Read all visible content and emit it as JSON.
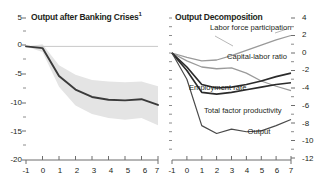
{
  "figure": {
    "background": "#ffffff",
    "line_color": "#3a3a3a",
    "band_color": "#e3e3e3",
    "axis_color": "#8c8c8c"
  },
  "chart_data": [
    {
      "type": "line",
      "panel": "left",
      "title": "Output after Banking Crises",
      "title_footnote": "1",
      "xlabel": "",
      "ylabel": "",
      "x": [
        -1,
        0,
        1,
        2,
        3,
        4,
        5,
        6,
        7
      ],
      "xlim": [
        -1,
        7
      ],
      "ylim": [
        -20,
        5
      ],
      "xticks": [
        "-1",
        "0",
        "1",
        "2",
        "3",
        "4",
        "5",
        "6",
        "7"
      ],
      "yticks": [
        "5",
        "0",
        "-5",
        "-10",
        "-15",
        "-20"
      ],
      "minor_yticks": [
        2.5,
        -2.5,
        -7.5,
        -12.5,
        -17.5
      ],
      "grid": false,
      "legend": "none",
      "zero_line": true,
      "series": [
        {
          "name": "Output",
          "values": [
            0.0,
            -0.3,
            -5.2,
            -7.6,
            -8.9,
            -9.4,
            -9.5,
            -9.3,
            -10.3
          ]
        }
      ],
      "confidence_band": {
        "name": "confidence interval",
        "upper": [
          0.0,
          0.4,
          -3.3,
          -5.0,
          -5.9,
          -6.2,
          -6.3,
          -6.2,
          -7.0
        ],
        "lower": [
          0.0,
          -1.0,
          -7.1,
          -10.4,
          -11.9,
          -12.6,
          -12.9,
          -12.6,
          -13.9
        ]
      }
    },
    {
      "type": "line",
      "panel": "right",
      "title": "Output Decomposition",
      "xlabel": "",
      "ylabel": "",
      "x": [
        -1,
        0,
        1,
        2,
        3,
        4,
        5,
        6,
        7
      ],
      "xlim": [
        -1,
        7
      ],
      "ylim": [
        -12,
        4
      ],
      "xticks": [
        "-1",
        "0",
        "1",
        "2",
        "3",
        "4",
        "5",
        "6",
        "7"
      ],
      "yticks": [
        "4",
        "2",
        "0",
        "-2",
        "-4",
        "-6",
        "-8",
        "-10",
        "-12"
      ],
      "minor_yticks": [
        3,
        1,
        -1,
        -3,
        -5,
        -7,
        -9,
        -11
      ],
      "grid": false,
      "legend": "inline-annotations",
      "series": [
        {
          "name": "Labor force participation",
          "values": [
            0.0,
            -0.5,
            -0.9,
            -0.8,
            -0.3,
            0.3,
            0.9,
            1.5,
            2.0
          ],
          "label_position": {
            "x": 243,
            "y": 27
          }
        },
        {
          "name": "Capital-labor ratio",
          "values": [
            0.0,
            -0.9,
            -1.6,
            -1.8,
            -1.7,
            -2.3,
            -3.2,
            -3.8,
            -4.3
          ],
          "label_position": {
            "x": 265,
            "y": 57
          }
        },
        {
          "name": "Employment rate",
          "values": [
            0.0,
            -1.6,
            -3.6,
            -4.0,
            -3.9,
            -3.6,
            -3.2,
            -2.7,
            -2.3
          ],
          "label_position": {
            "x": 219,
            "y": 88
          }
        },
        {
          "name": "Total factor productivity",
          "values": [
            0.0,
            -2.0,
            -4.5,
            -4.7,
            -4.5,
            -4.2,
            -3.9,
            -3.6,
            -3.4
          ],
          "label_position": {
            "x": 246,
            "y": 110
          }
        },
        {
          "name": "Output",
          "values": [
            0.0,
            -3.0,
            -8.3,
            -9.2,
            -8.7,
            -9.0,
            -8.9,
            -8.3,
            -7.6
          ],
          "label_position": {
            "x": 259,
            "y": 128
          }
        }
      ]
    }
  ]
}
